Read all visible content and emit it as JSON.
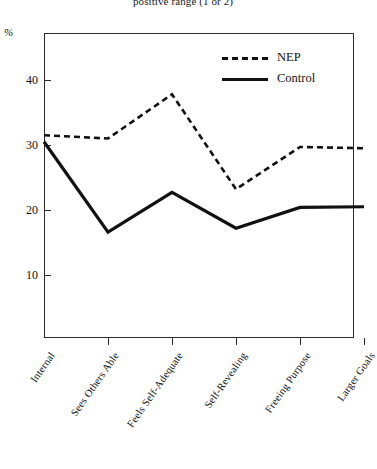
{
  "chart_data": {
    "type": "line",
    "title": "positive range (1 or 2)",
    "xlabel": "",
    "ylabel": "%",
    "ylim": [
      0,
      45
    ],
    "yticks": [
      10,
      20,
      30,
      40
    ],
    "ytick_labels": [
      "10",
      "20",
      "30",
      "40"
    ],
    "grid": false,
    "legend_position": "top-right",
    "categories": [
      "Internal",
      "Sees Others Able",
      "Feels Self-Adequate",
      "Self-Revealing",
      "Freeing Purpose",
      "Larger Goals"
    ],
    "series": [
      {
        "name": "NEP",
        "style": "dashed",
        "color": "#111111",
        "values": [
          31.5,
          31.0,
          37.8,
          23.2,
          29.7,
          29.5
        ]
      },
      {
        "name": "Control",
        "style": "solid",
        "color": "#111111",
        "values": [
          30.5,
          16.6,
          22.7,
          17.2,
          20.4,
          20.5
        ]
      }
    ]
  },
  "legend": {
    "items": [
      {
        "label": "NEP",
        "style": "dashed"
      },
      {
        "label": "Control",
        "style": "solid"
      }
    ]
  }
}
